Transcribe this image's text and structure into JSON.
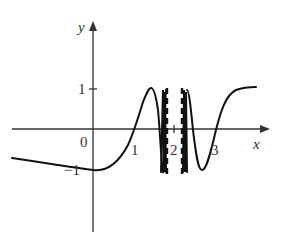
{
  "diagram": {
    "type": "function-graph",
    "axes": {
      "x_label": "x",
      "y_label": "y",
      "origin_label": "0",
      "x_ticks": [
        {
          "value": 1,
          "label": "1"
        },
        {
          "value": 2,
          "label": "2"
        },
        {
          "value": 3,
          "label": "3"
        }
      ],
      "y_ticks": [
        {
          "value": 1,
          "label": "1"
        },
        {
          "value": -1,
          "label": "−1"
        }
      ]
    },
    "asymptotes": [
      {
        "x": 1.8,
        "style": "dashed"
      },
      {
        "x": 2.2,
        "style": "dashed"
      }
    ],
    "colors": {
      "curve": "#111111",
      "axes": "#333333",
      "background": "#ffffff"
    }
  },
  "labels": {
    "x": "x",
    "y": "y",
    "origin": "0",
    "tick_x1": "1",
    "tick_x2": "2",
    "tick_x3": "3",
    "tick_y1": "1",
    "tick_ym1": "−1"
  }
}
